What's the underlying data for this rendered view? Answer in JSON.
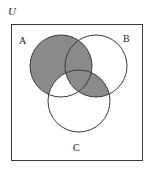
{
  "diagram": {
    "universe_label": "U",
    "sets": [
      {
        "label": "A",
        "cx": 61,
        "cy": 66,
        "r": 31
      },
      {
        "label": "B",
        "cx": 96,
        "cy": 66,
        "r": 31
      },
      {
        "label": "C",
        "cx": 79,
        "cy": 101,
        "r": 31
      }
    ],
    "shaded_regions": [
      "A only",
      "A∩B only",
      "A∩B∩C",
      "B∩C only"
    ],
    "unshaded_regions": [
      "B only",
      "C only",
      "A∩C only",
      "outside"
    ],
    "colors": {
      "shade": "#8a8a8a",
      "stroke": "#3a3a3a",
      "background": "#ffffff"
    }
  }
}
